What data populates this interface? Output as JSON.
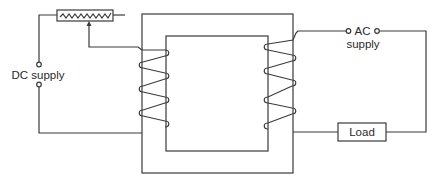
{
  "diagram": {
    "labels": {
      "dc_supply": "DC supply",
      "ac_line1": "AC",
      "ac_line2": "supply",
      "load": "Load"
    },
    "components": [
      {
        "name": "rheostat",
        "type": "variable-resistor"
      },
      {
        "name": "transformer-core",
        "type": "rectangular-core"
      },
      {
        "name": "primary-coil",
        "type": "winding",
        "leg": "left",
        "turns": 4
      },
      {
        "name": "secondary-coil",
        "type": "winding",
        "leg": "right",
        "turns": 4
      },
      {
        "name": "dc-supply-terminals",
        "type": "terminal-pair"
      },
      {
        "name": "ac-supply-terminals",
        "type": "terminal-pair"
      },
      {
        "name": "load",
        "type": "resistor-box"
      }
    ],
    "colors": {
      "line": "#3a3a3a",
      "text": "#2a2a2a",
      "background": "#ffffff"
    }
  }
}
